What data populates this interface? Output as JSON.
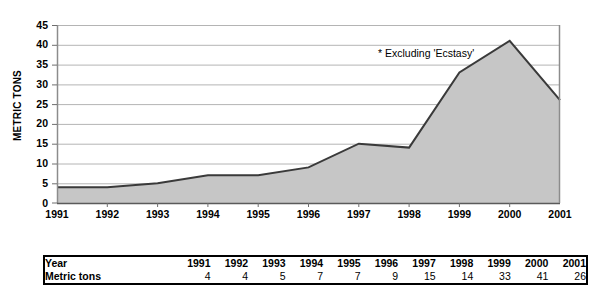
{
  "chart_data": {
    "type": "area",
    "title": "",
    "xlabel": "",
    "ylabel": "METRIC TONS",
    "categories": [
      "1991",
      "1992",
      "1993",
      "1994",
      "1995",
      "1996",
      "1997",
      "1998",
      "1999",
      "2000",
      "2001"
    ],
    "values": [
      4,
      4,
      5,
      7,
      7,
      9,
      15,
      14,
      33,
      41,
      26
    ],
    "series": [
      {
        "name": "Metric tons",
        "values": [
          4,
          4,
          5,
          7,
          7,
          9,
          15,
          14,
          33,
          41,
          26
        ]
      }
    ],
    "ylim": [
      0,
      45
    ],
    "ytick_labels": [
      "0",
      "5",
      "10",
      "15",
      "20",
      "25",
      "30",
      "35",
      "40",
      "45"
    ],
    "ytick_values": [
      0,
      5,
      10,
      15,
      20,
      25,
      30,
      35,
      40,
      45
    ],
    "grid": true,
    "legend": "none",
    "annotations": [
      {
        "text": "* Excluding 'Ecstasy'",
        "x": "1998",
        "y": 38
      }
    ],
    "colors": {
      "area_fill": "#c6c6c6",
      "line": "#3a3a3a",
      "gridline": "#b4b4b4",
      "axis": "#808080",
      "text": "#000000"
    }
  },
  "axis": {
    "y_title": "METRIC TONS",
    "y_ticks": [
      "45",
      "40",
      "35",
      "30",
      "25",
      "20",
      "15",
      "10",
      "5",
      "0"
    ],
    "x_ticks": [
      "1991",
      "1992",
      "1993",
      "1994",
      "1995",
      "1996",
      "1997",
      "1998",
      "1999",
      "2000",
      "2001"
    ]
  },
  "annotation": {
    "footnote": "* Excluding 'Ecstasy'"
  },
  "table": {
    "row_labels": [
      "Year",
      "Metric tons"
    ],
    "years": [
      "1991",
      "1992",
      "1993",
      "1994",
      "1995",
      "1996",
      "1997",
      "1998",
      "1999",
      "2000",
      "2001"
    ],
    "metric_tons": [
      "4",
      "4",
      "5",
      "7",
      "7",
      "9",
      "15",
      "14",
      "33",
      "41",
      "26"
    ]
  }
}
